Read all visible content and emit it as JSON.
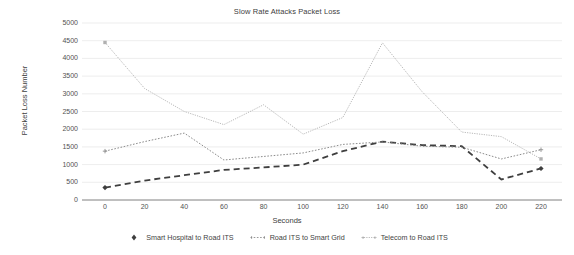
{
  "chart_data": {
    "type": "line",
    "title": "Slow Rate Attacks Packet Loss",
    "xlabel": "Seconds",
    "ylabel": "Packet Loss Number",
    "x": [
      0,
      20,
      40,
      60,
      80,
      100,
      120,
      140,
      160,
      180,
      200,
      220
    ],
    "xlim": [
      -10,
      230
    ],
    "ylim": [
      0,
      5000
    ],
    "yticks": [
      0,
      500,
      1000,
      1500,
      2000,
      2500,
      3000,
      3500,
      4000,
      4500,
      5000
    ],
    "xticks": [
      0,
      20,
      40,
      60,
      80,
      100,
      120,
      140,
      160,
      180,
      200,
      220
    ],
    "ytick_labels": [
      "0",
      "500",
      "1000",
      "1500",
      "2000",
      "2500",
      "3000",
      "3500",
      "4000",
      "4500",
      "5000"
    ],
    "xtick_labels": [
      "0",
      "20",
      "40",
      "60",
      "80",
      "100",
      "120",
      "140",
      "160",
      "180",
      "200",
      "220"
    ],
    "grid": true,
    "grid_axis": "y",
    "legend_position": "bottom",
    "series": [
      {
        "name": "Smart Hospital to Road ITS",
        "style": "thick-dashed",
        "color": "#3f3f3f",
        "marker": "diamond",
        "values": [
          350,
          550,
          700,
          850,
          920,
          1000,
          1380,
          1650,
          1550,
          1520,
          580,
          890
        ]
      },
      {
        "name": "Road ITS to Smart Grid",
        "style": "dotted",
        "color": "#8c8c8c",
        "marker": "plus",
        "values": [
          1380,
          1650,
          1890,
          1130,
          1230,
          1330,
          1570,
          1640,
          1520,
          1490,
          1160,
          1420
        ]
      },
      {
        "name": "Telecom to Road ITS",
        "style": "fine-dotted",
        "color": "#b0b0b0",
        "marker": "square",
        "values": [
          4450,
          3150,
          2500,
          2130,
          2690,
          1860,
          2330,
          4440,
          3060,
          1920,
          1790,
          1160
        ]
      }
    ]
  },
  "chart": {
    "title": "Slow Rate Attacks Packet Loss",
    "y_axis_title": "Packet Loss Number",
    "x_axis_title": "Seconds"
  },
  "legend": {
    "items": [
      {
        "label": "Smart Hospital to Road ITS"
      },
      {
        "label": "Road ITS to Smart Grid"
      },
      {
        "label": "Telecom to Road ITS"
      }
    ]
  },
  "colors": {
    "series1": "#3f3f3f",
    "series2": "#8c8c8c",
    "series3": "#b0b0b0",
    "grid": "#e8e8e8",
    "axis": "#808080",
    "text": "#404040"
  }
}
